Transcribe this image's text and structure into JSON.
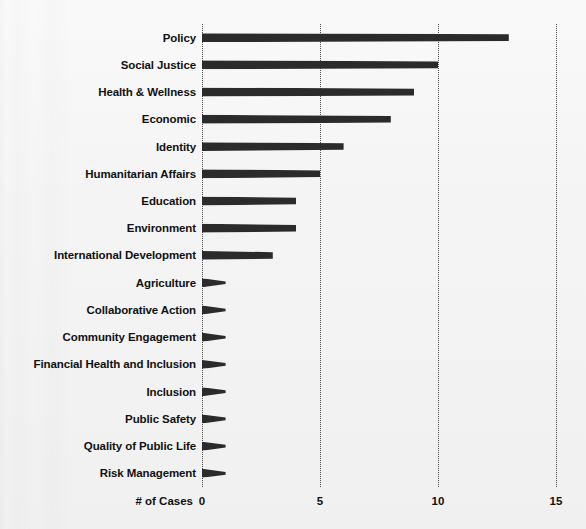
{
  "chart_data": {
    "type": "bar",
    "orientation": "horizontal",
    "title": "",
    "xlabel": "# of Cases",
    "ylabel": "",
    "xlim": [
      0,
      15
    ],
    "xticks": [
      0,
      5,
      10,
      15
    ],
    "xtick_labels": [
      "0",
      "5",
      "10",
      "15"
    ],
    "grid": "vertical-dotted",
    "legend": "none",
    "bar_color": "#2b2b2b",
    "background_color": "#f4f4f4",
    "categories": [
      "Policy",
      "Social Justice",
      "Health & Wellness",
      "Economic",
      "Identity",
      "Humanitarian Affairs",
      "Education",
      "Environment",
      "International Development",
      "Agriculture",
      "Collaborative Action",
      "Community Engagement",
      "Financial Health and Inclusion",
      "Inclusion",
      "Public Safety",
      "Quality of Public Life",
      "Risk Management"
    ],
    "values": [
      13,
      10,
      9,
      8,
      6,
      5,
      4,
      4,
      3,
      1,
      1,
      1,
      1,
      1,
      1,
      1,
      1
    ]
  }
}
